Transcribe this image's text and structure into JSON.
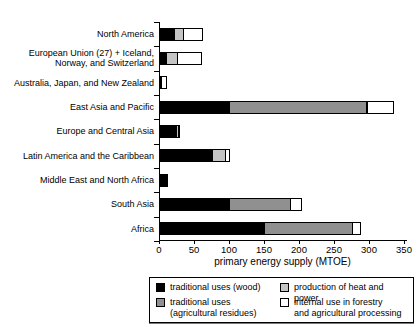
{
  "chart_data": {
    "type": "bar",
    "orientation": "horizontal",
    "stacked": true,
    "title": "",
    "xlabel": "primary energy supply (MTOE)",
    "ylabel": "",
    "xlim": [
      0,
      350
    ],
    "xticks": [
      0,
      50,
      100,
      150,
      200,
      250,
      300,
      350
    ],
    "grid": false,
    "legend_position": "bottom-box",
    "categories": [
      "North America",
      "European Union (27) + Iceland, Norway, and Switzerland",
      "Australia, Japan, and New Zealand",
      "East Asia and Pacific",
      "Europe and Central Asia",
      "Latin America and the Caribbean",
      "Middle East and North Africa",
      "South Asia",
      "Africa"
    ],
    "series": [
      {
        "name": "traditional uses (wood)",
        "color": "#000000",
        "values": [
          21,
          10,
          2,
          100,
          24,
          76,
          12,
          100,
          150
        ]
      },
      {
        "name": "traditional uses (agricultural residues)",
        "color": "#909090",
        "values": [
          0,
          0,
          0,
          197,
          0,
          0,
          0,
          88,
          127
        ]
      },
      {
        "name": "production of heat and power",
        "color": "#c4c4c4",
        "values": [
          14,
          17,
          0,
          3,
          4,
          20,
          0,
          0,
          0
        ]
      },
      {
        "name": "internal use in forestry and agricultural processing",
        "color": "#ffffff",
        "values": [
          28,
          36,
          8,
          38,
          3,
          7,
          0,
          17,
          13
        ]
      }
    ],
    "legend_items": [
      {
        "lines": [
          "traditional uses (wood)"
        ],
        "color": "#000000"
      },
      {
        "lines": [
          "traditional uses",
          "(agricultural residues)"
        ],
        "color": "#909090"
      },
      {
        "lines": [
          "production of heat and power"
        ],
        "color": "#c4c4c4"
      },
      {
        "lines": [
          "internal use in forestry",
          "and agricultural processing"
        ],
        "color": "#ffffff"
      }
    ]
  }
}
